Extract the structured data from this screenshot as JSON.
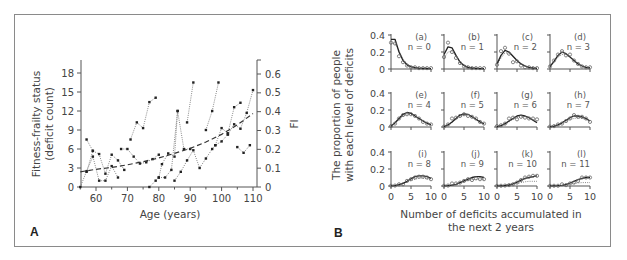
{
  "chart_data": [
    {
      "panel": "A",
      "type": "line",
      "xlabel": "Age (years)",
      "ylabel": "Fitness-frailty status (deficit count)",
      "ylabel_lines": [
        "Fitness-frailty status",
        "(deficit count)"
      ],
      "y2label": "FI",
      "xlim": [
        54,
        111
      ],
      "ylim": [
        0,
        20
      ],
      "y2lim": [
        0,
        0.667
      ],
      "xticks": [
        60,
        70,
        80,
        90,
        100,
        110
      ],
      "yticks": [
        0,
        3,
        6,
        9,
        12,
        15,
        18
      ],
      "y2ticks": [
        0,
        0.1,
        0.2,
        0.3,
        0.4,
        0.5,
        0.6
      ],
      "y2tick_labels": [
        "0",
        "0.1",
        "0.2",
        "0.3",
        "0.4",
        "0.5",
        "0.6"
      ],
      "grid": false,
      "series": [
        {
          "name": "individual-1",
          "style": "dotted",
          "points": [
            [
              55,
              0
            ],
            [
              57,
              2.5
            ],
            [
              59,
              4.8
            ],
            [
              61,
              1
            ],
            [
              63,
              1
            ],
            [
              65,
              3.3
            ],
            [
              67,
              1.5
            ]
          ]
        },
        {
          "name": "individual-2",
          "style": "dotted",
          "points": [
            [
              57,
              7.5
            ],
            [
              59,
              5.7
            ],
            [
              61,
              5.2
            ],
            [
              63,
              2.1
            ],
            [
              65,
              5.1
            ],
            [
              67,
              4.2
            ],
            [
              69,
              2.7
            ]
          ]
        },
        {
          "name": "individual-3",
          "style": "dotted",
          "points": [
            [
              57,
              2.4
            ],
            [
              59,
              5.7
            ]
          ]
        },
        {
          "name": "individual-4",
          "style": "dotted",
          "points": [
            [
              68,
              6
            ],
            [
              70,
              6
            ],
            [
              72,
              4.8
            ],
            [
              74,
              3.7
            ],
            [
              76,
              3.9
            ],
            [
              78,
              4.4
            ],
            [
              80,
              5.1
            ]
          ]
        },
        {
          "name": "individual-5",
          "style": "dotted",
          "points": [
            [
              71,
              7.5
            ],
            [
              73,
              10.2
            ],
            [
              75,
              9.3
            ],
            [
              77,
              13.4
            ],
            [
              79,
              14.1
            ]
          ]
        },
        {
          "name": "individual-6",
          "style": "dotted",
          "points": [
            [
              77,
              0
            ],
            [
              79,
              1
            ],
            [
              80,
              1.5
            ],
            [
              81,
              3.6
            ],
            [
              83,
              5.3
            ],
            [
              85,
              4.8
            ],
            [
              86,
              12
            ],
            [
              88,
              6
            ],
            [
              90,
              6
            ]
          ]
        },
        {
          "name": "individual-7",
          "style": "dotted",
          "points": [
            [
              80,
              1.5
            ],
            [
              82,
              1.5
            ],
            [
              84,
              2.7
            ],
            [
              86,
              12
            ]
          ]
        },
        {
          "name": "individual-8",
          "style": "dotted",
          "points": [
            [
              85,
              1
            ],
            [
              87,
              2.4
            ],
            [
              89,
              4.2
            ],
            [
              91,
              5.8
            ],
            [
              93,
              3
            ],
            [
              95,
              4.5
            ],
            [
              97,
              6
            ],
            [
              98,
              6.6
            ],
            [
              100,
              7.2
            ],
            [
              102,
              8.3
            ]
          ]
        },
        {
          "name": "individual-9",
          "style": "dotted",
          "points": [
            [
              89,
              10.2
            ],
            [
              91,
              16.5
            ]
          ]
        },
        {
          "name": "individual-10",
          "style": "dotted",
          "points": [
            [
              95,
              9
            ],
            [
              97,
              12
            ],
            [
              99,
              16.5
            ]
          ]
        },
        {
          "name": "individual-11",
          "style": "dotted",
          "points": [
            [
              98,
              6.6
            ],
            [
              100,
              9.3
            ],
            [
              102,
              8.5
            ],
            [
              104,
              12.6
            ],
            [
              106,
              13.3
            ]
          ]
        },
        {
          "name": "individual-12",
          "style": "dotted",
          "points": [
            [
              102,
              8.3
            ],
            [
              104,
              9.9
            ],
            [
              106,
              9.2
            ],
            [
              108,
              11.7
            ],
            [
              110,
              15.3
            ]
          ]
        },
        {
          "name": "individual-13",
          "style": "dotted",
          "points": [
            [
              105,
              6.3
            ],
            [
              107,
              5.4
            ],
            [
              109,
              6.6
            ]
          ]
        },
        {
          "name": "mean-trend",
          "style": "dashed",
          "points": [
            [
              55,
              2.4
            ],
            [
              60,
              2.8
            ],
            [
              65,
              3.1
            ],
            [
              70,
              3.5
            ],
            [
              75,
              4
            ],
            [
              80,
              4.6
            ],
            [
              85,
              5.3
            ],
            [
              90,
              6.1
            ],
            [
              95,
              7.1
            ],
            [
              100,
              8.3
            ],
            [
              105,
              9.8
            ],
            [
              110,
              11.6
            ]
          ]
        }
      ],
      "panel_label": "A"
    },
    {
      "panel": "B",
      "type": "line",
      "xlabel": "Number of deficits accumulated in the next 2 years",
      "xlabel_lines": [
        "Number of deficits accumulated in",
        "the next 2 years"
      ],
      "ylabel": "The proportion of people with each level of deficits",
      "ylabel_lines": [
        "The proportion of people",
        "with each level of deficits"
      ],
      "xlim": [
        0,
        10
      ],
      "ylim": [
        0,
        0.4
      ],
      "xticks": [
        0,
        5,
        10
      ],
      "yticks": [
        0,
        0.2,
        0.4
      ],
      "ytick_labels": [
        "0",
        "0.2",
        "0.4"
      ],
      "grid": false,
      "legend": "none",
      "subplots": [
        {
          "tag": "(a)",
          "n_label": "n = 0",
          "n": 0,
          "model": [
            0.35,
            0.35,
            0.2,
            0.1,
            0.05,
            0.025,
            0.015,
            0.01,
            0.008,
            0.006,
            0.005
          ],
          "fit_dotted": [
            0.3,
            0.3,
            0.22,
            0.12,
            0.06,
            0.03,
            0.02,
            0.012,
            0.01,
            0.008,
            0.006
          ],
          "observed": [
            0.31,
            0.3,
            0.15,
            0.08,
            0.04,
            0.02,
            0.02,
            0.01,
            0.01,
            0.01,
            0.01
          ]
        },
        {
          "tag": "(b)",
          "n_label": "n = 1",
          "n": 1,
          "model": [
            0.17,
            0.26,
            0.25,
            0.16,
            0.08,
            0.04,
            0.02,
            0.012,
            0.008,
            0.005,
            0.004
          ],
          "fit_dotted": [
            0.13,
            0.2,
            0.21,
            0.15,
            0.09,
            0.05,
            0.03,
            0.015,
            0.01,
            0.006,
            0.004
          ],
          "observed": [
            0.14,
            0.31,
            0.2,
            0.13,
            0.07,
            0.03,
            0.02,
            0.01,
            0.01,
            0.01,
            0.01
          ]
        },
        {
          "tag": "(c)",
          "n_label": "n = 2",
          "n": 2,
          "model": [
            0.06,
            0.16,
            0.22,
            0.2,
            0.15,
            0.1,
            0.06,
            0.035,
            0.02,
            0.012,
            0.007
          ],
          "fit_dotted": [
            0.05,
            0.13,
            0.19,
            0.19,
            0.15,
            0.1,
            0.065,
            0.04,
            0.022,
            0.013,
            0.008
          ],
          "observed": [
            0.05,
            0.21,
            0.25,
            0.18,
            0.08,
            0.09,
            0.04,
            0.02,
            0.02,
            0.01,
            0.01
          ]
        },
        {
          "tag": "(d)",
          "n_label": "n = 3",
          "n": 3,
          "model": [
            0.03,
            0.09,
            0.16,
            0.2,
            0.18,
            0.14,
            0.1,
            0.06,
            0.035,
            0.02,
            0.012
          ],
          "fit_dotted": [
            0.025,
            0.08,
            0.14,
            0.17,
            0.17,
            0.14,
            0.1,
            0.065,
            0.04,
            0.022,
            0.013
          ],
          "observed": [
            0.03,
            0.1,
            0.17,
            0.21,
            0.16,
            0.17,
            0.1,
            0.06,
            0.03,
            0.02,
            0.02
          ]
        },
        {
          "tag": "(e)",
          "n_label": "n = 4",
          "n": 4,
          "model": [
            0.01,
            0.05,
            0.1,
            0.15,
            0.17,
            0.16,
            0.13,
            0.1,
            0.07,
            0.045,
            0.025
          ],
          "fit_dotted": [
            0.01,
            0.04,
            0.09,
            0.13,
            0.15,
            0.15,
            0.13,
            0.1,
            0.075,
            0.05,
            0.03
          ],
          "observed": [
            0.01,
            0.04,
            0.1,
            0.14,
            0.15,
            0.15,
            0.13,
            0.1,
            0.06,
            0.04,
            0.03
          ]
        },
        {
          "tag": "(f)",
          "n_label": "n = 5",
          "n": 5,
          "model": [
            0.005,
            0.025,
            0.06,
            0.1,
            0.14,
            0.155,
            0.15,
            0.12,
            0.09,
            0.06,
            0.035
          ],
          "fit_dotted": [
            0.005,
            0.02,
            0.05,
            0.09,
            0.12,
            0.14,
            0.14,
            0.12,
            0.095,
            0.065,
            0.04
          ],
          "observed": [
            0.005,
            0.03,
            0.1,
            0.11,
            0.13,
            0.15,
            0.13,
            0.12,
            0.1,
            0.06,
            0.04
          ]
        },
        {
          "tag": "(g)",
          "n_label": "n = 6",
          "n": 6,
          "model": [
            0.003,
            0.015,
            0.04,
            0.07,
            0.1,
            0.13,
            0.14,
            0.13,
            0.11,
            0.08,
            0.05
          ],
          "fit_dotted": [
            0.003,
            0.012,
            0.03,
            0.06,
            0.09,
            0.11,
            0.12,
            0.12,
            0.11,
            0.09,
            0.065
          ],
          "observed": [
            0.01,
            0.02,
            0.04,
            0.1,
            0.11,
            0.09,
            0.12,
            0.11,
            0.1,
            0.1,
            0.09
          ]
        },
        {
          "tag": "(h)",
          "n_label": "n = 7",
          "n": 7,
          "model": [
            0.002,
            0.01,
            0.025,
            0.05,
            0.08,
            0.11,
            0.13,
            0.13,
            0.12,
            0.1,
            0.07
          ],
          "fit_dotted": [
            0.002,
            0.008,
            0.02,
            0.04,
            0.065,
            0.09,
            0.1,
            0.11,
            0.1,
            0.09,
            0.07
          ],
          "observed": [
            0.005,
            0.01,
            0.03,
            0.04,
            0.07,
            0.1,
            0.14,
            0.12,
            0.12,
            0.1,
            0.06
          ]
        },
        {
          "tag": "(i)",
          "n_label": "n = 8",
          "n": 8,
          "model": [
            0.001,
            0.005,
            0.015,
            0.03,
            0.055,
            0.085,
            0.11,
            0.12,
            0.12,
            0.11,
            0.09
          ],
          "fit_dotted": [
            0.001,
            0.004,
            0.01,
            0.025,
            0.045,
            0.065,
            0.08,
            0.09,
            0.09,
            0.085,
            0.075
          ],
          "observed": [
            0.003,
            0.005,
            0.02,
            0.02,
            0.06,
            0.08,
            0.1,
            0.11,
            0.11,
            0.1,
            0.08
          ]
        },
        {
          "tag": "(j)",
          "n_label": "n = 9",
          "n": 9,
          "model": [
            0.001,
            0.004,
            0.01,
            0.02,
            0.04,
            0.06,
            0.08,
            0.1,
            0.11,
            0.11,
            0.1
          ],
          "fit_dotted": [
            0.001,
            0.003,
            0.008,
            0.018,
            0.035,
            0.05,
            0.065,
            0.075,
            0.08,
            0.08,
            0.075
          ],
          "observed": [
            0.003,
            0.005,
            0.03,
            0.03,
            0.04,
            0.06,
            0.08,
            0.07,
            0.09,
            0.08,
            0.08
          ]
        },
        {
          "tag": "(k)",
          "n_label": "n = 10",
          "n": 10,
          "model": [
            0.001,
            0.002,
            0.006,
            0.012,
            0.025,
            0.045,
            0.07,
            0.09,
            0.1,
            0.11,
            0.12
          ],
          "fit_dotted": [
            0.001,
            0.002,
            0.005,
            0.01,
            0.02,
            0.03,
            0.04,
            0.05,
            0.055,
            0.055,
            0.055
          ],
          "observed": [
            0.002,
            0.003,
            0.005,
            0.01,
            0.02,
            0.04,
            0.07,
            0.1,
            0.11,
            0.12,
            0.12
          ]
        },
        {
          "tag": "(l)",
          "n_label": "n = 11",
          "n": 11,
          "model": [
            0.001,
            0.002,
            0.004,
            0.008,
            0.018,
            0.035,
            0.055,
            0.075,
            0.09,
            0.1,
            0.1
          ],
          "fit_dotted": [
            0.001,
            0.002,
            0.004,
            0.008,
            0.014,
            0.022,
            0.03,
            0.035,
            0.04,
            0.04,
            0.04
          ],
          "observed": [
            0.002,
            0.003,
            0.003,
            0.02,
            0.01,
            0.03,
            0.04,
            0.06,
            0.1,
            0.1,
            0.1
          ]
        }
      ],
      "panel_label": "B"
    }
  ]
}
